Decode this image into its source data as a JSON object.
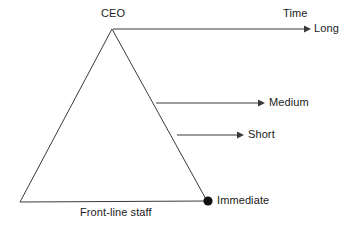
{
  "diagram": {
    "type": "triangle-time-horizon",
    "colors": {
      "background": "#ffffff",
      "stroke": "#3a3a3a",
      "text": "#1a1a1a",
      "marker_fill": "#111111"
    },
    "shape": {
      "name": "hierarchy-triangle",
      "apex": {
        "x": 112,
        "y": 29
      },
      "bottom_left": {
        "x": 20,
        "y": 202
      },
      "bottom_right": {
        "x": 207,
        "y": 201
      }
    },
    "labels": {
      "apex": "CEO",
      "base": "Front-line staff",
      "axis": "Time"
    },
    "arrows": [
      {
        "id": "long",
        "label": "Long",
        "start": {
          "x": 113,
          "y": 29
        },
        "end": {
          "x": 310,
          "y": 29
        },
        "has_arrowhead": true
      },
      {
        "id": "medium",
        "label": "Medium",
        "start": {
          "x": 156,
          "y": 103
        },
        "end": {
          "x": 264,
          "y": 103
        },
        "has_arrowhead": true
      },
      {
        "id": "short",
        "label": "Short",
        "start": {
          "x": 177,
          "y": 135
        },
        "end": {
          "x": 243,
          "y": 135
        },
        "has_arrowhead": true
      }
    ],
    "marker": {
      "id": "immediate",
      "label": "Immediate",
      "center": {
        "x": 208,
        "y": 201
      },
      "radius": 4.5
    }
  }
}
